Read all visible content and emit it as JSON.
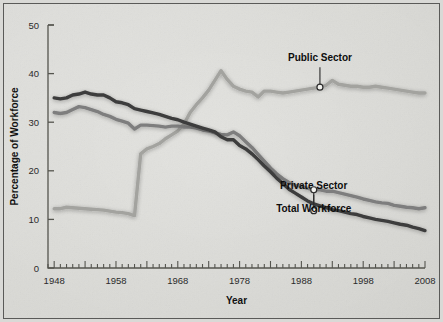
{
  "figure": {
    "background_color": "#ddddd9",
    "border_color": "#5a5a58"
  },
  "chart_data": {
    "type": "line",
    "title": "",
    "xlabel": "Year",
    "ylabel": "Percentage of Workforce",
    "xlim": [
      1947,
      2008
    ],
    "ylim": [
      0,
      50
    ],
    "yticks": [
      0,
      10,
      20,
      30,
      40,
      50
    ],
    "ytick_labels": [
      "0",
      "10",
      "20",
      "30",
      "40",
      "50"
    ],
    "xticks": [
      1948,
      1958,
      1968,
      1978,
      1988,
      1998,
      2008
    ],
    "xtick_labels": [
      "1948",
      "1958",
      "1968",
      "1978",
      "1988",
      "1998",
      "2008"
    ],
    "x_minor_tick_interval": 1,
    "x_major_tick_interval": 5,
    "grid": false,
    "legend": "annotations",
    "legend_position": "inline-annotations",
    "x": [
      1948,
      1949,
      1950,
      1951,
      1952,
      1953,
      1954,
      1955,
      1956,
      1957,
      1958,
      1959,
      1960,
      1961,
      1962,
      1963,
      1964,
      1965,
      1966,
      1967,
      1968,
      1969,
      1970,
      1971,
      1972,
      1973,
      1974,
      1975,
      1976,
      1977,
      1978,
      1979,
      1980,
      1981,
      1982,
      1983,
      1984,
      1985,
      1986,
      1987,
      1988,
      1989,
      1990,
      1991,
      1992,
      1993,
      1994,
      1995,
      1996,
      1997,
      1998,
      1999,
      2000,
      2001,
      2002,
      2003,
      2004,
      2005,
      2006,
      2007,
      2008
    ],
    "series": [
      {
        "name": "Private Sector",
        "color": "#3c3c3c",
        "line_width": 3.4,
        "values": [
          35.0,
          34.8,
          35.0,
          35.6,
          35.8,
          36.2,
          35.8,
          35.6,
          35.6,
          35.0,
          34.2,
          34.0,
          33.6,
          32.8,
          32.5,
          32.2,
          31.9,
          31.6,
          31.2,
          30.8,
          30.5,
          30.0,
          29.6,
          29.2,
          28.8,
          28.4,
          28.0,
          27.0,
          26.4,
          26.4,
          25.2,
          24.5,
          23.5,
          22.3,
          21.0,
          19.8,
          18.5,
          17.4,
          16.2,
          15.4,
          14.6,
          13.8,
          13.2,
          12.8,
          12.4,
          12.0,
          11.8,
          11.5,
          11.2,
          11.0,
          10.6,
          10.3,
          10.0,
          9.8,
          9.6,
          9.3,
          9.0,
          8.8,
          8.4,
          8.1,
          7.7
        ],
        "annotation": {
          "label": "Private Sector",
          "x": 1990,
          "y": 11.8,
          "label_offset_y": -22
        }
      },
      {
        "name": "Total Workforce",
        "color": "#7e7e7e",
        "line_width": 3.4,
        "values": [
          32.0,
          31.8,
          32.0,
          32.6,
          33.2,
          33.0,
          32.6,
          32.2,
          31.6,
          31.2,
          30.6,
          30.2,
          29.8,
          28.6,
          29.4,
          29.4,
          29.3,
          29.2,
          29.0,
          29.2,
          29.2,
          29.0,
          29.0,
          28.8,
          28.4,
          28.2,
          27.8,
          27.5,
          27.4,
          28.0,
          27.2,
          26.0,
          24.8,
          23.4,
          22.0,
          20.6,
          19.4,
          18.4,
          17.6,
          17.0,
          16.8,
          16.4,
          16.1,
          16.1,
          15.8,
          15.8,
          15.5,
          15.2,
          14.9,
          14.6,
          14.2,
          13.9,
          13.6,
          13.4,
          13.3,
          12.9,
          12.7,
          12.5,
          12.4,
          12.2,
          12.4
        ],
        "annotation": {
          "label": "Total Workforce",
          "x": 1990,
          "y": 16.1,
          "label_offset_y": 22
        }
      },
      {
        "name": "Public Sector",
        "color": "#a3a39f",
        "line_width": 3.4,
        "values": [
          12.2,
          12.2,
          12.5,
          12.4,
          12.3,
          12.2,
          12.1,
          12.0,
          11.9,
          11.7,
          11.5,
          11.4,
          11.2,
          10.8,
          23.5,
          24.5,
          25.0,
          25.6,
          26.6,
          27.4,
          28.2,
          29.6,
          32.0,
          33.6,
          35.0,
          36.6,
          38.6,
          40.6,
          38.8,
          37.4,
          36.8,
          36.4,
          36.2,
          35.2,
          36.4,
          36.4,
          36.2,
          36.0,
          36.2,
          36.4,
          36.6,
          36.8,
          37.0,
          37.2,
          37.6,
          38.6,
          37.8,
          37.6,
          37.4,
          37.4,
          37.2,
          37.2,
          37.4,
          37.2,
          37.0,
          36.8,
          36.6,
          36.4,
          36.2,
          36.0,
          36.0
        ],
        "annotation": {
          "label": "Public Sector",
          "x": 1991,
          "y": 37.2,
          "label_offset_y": -26
        }
      }
    ],
    "marker": {
      "shape": "circle",
      "fill": "#f2f2ee",
      "stroke": "#2a2a2a",
      "radius": 3
    }
  }
}
